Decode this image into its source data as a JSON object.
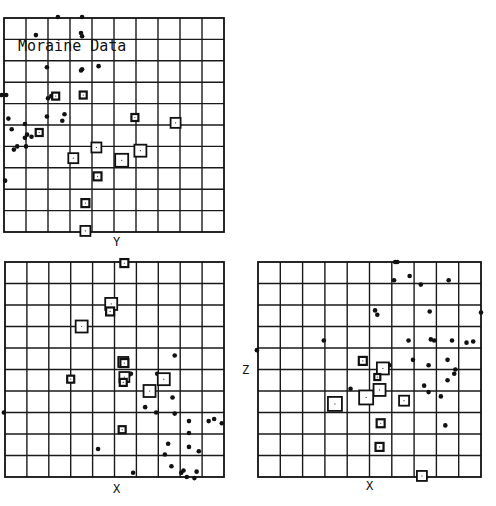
{
  "chart_data": [
    {
      "type": "scatter",
      "title": "Moraine Data",
      "xlabel": "Y",
      "ylabel": "",
      "grid": true,
      "grid_divisions": 10,
      "box": {
        "left": 4,
        "top": 18,
        "width": 220,
        "height": 214
      },
      "series": [
        {
          "name": "dots",
          "marker": "dot",
          "points": [
            [
              2.45,
              -0.05
            ],
            [
              3.55,
              -0.05
            ],
            [
              1.45,
              0.8
            ],
            [
              3.5,
              0.7
            ],
            [
              3.55,
              0.85
            ],
            [
              1.95,
              2.3
            ],
            [
              4.3,
              2.25
            ],
            [
              3.55,
              2.4
            ],
            [
              3.5,
              2.45
            ],
            [
              -0.1,
              3.6
            ],
            [
              0.1,
              3.6
            ],
            [
              2.0,
              3.75
            ],
            [
              2.15,
              3.65
            ],
            [
              2.3,
              3.7
            ],
            [
              1.95,
              4.6
            ],
            [
              2.75,
              4.5
            ],
            [
              2.65,
              4.8
            ],
            [
              0.2,
              4.7
            ],
            [
              0.35,
              5.2
            ],
            [
              0.95,
              4.95
            ],
            [
              1.05,
              5.45
            ],
            [
              1.25,
              5.55
            ],
            [
              0.95,
              5.6
            ],
            [
              0.45,
              6.15
            ],
            [
              0.6,
              6.0
            ],
            [
              1.0,
              6.0
            ],
            [
              0.05,
              7.6
            ]
          ]
        },
        {
          "name": "squares",
          "marker": "square",
          "points": [
            [
              2.35,
              3.65,
              7
            ],
            [
              3.6,
              3.6,
              7
            ],
            [
              1.6,
              5.35,
              7
            ],
            [
              5.95,
              4.65,
              7
            ],
            [
              7.8,
              4.9,
              10
            ],
            [
              4.2,
              6.05,
              10
            ],
            [
              3.15,
              6.55,
              10
            ],
            [
              5.35,
              6.65,
              13
            ],
            [
              6.2,
              6.2,
              12
            ],
            [
              4.25,
              7.4,
              8
            ],
            [
              3.7,
              8.65,
              8
            ],
            [
              3.7,
              9.95,
              10
            ]
          ]
        }
      ]
    },
    {
      "type": "scatter",
      "title": "",
      "xlabel": "X",
      "ylabel": "",
      "grid": true,
      "grid_divisions": 10,
      "box": {
        "left": 5,
        "top": 262,
        "width": 219,
        "height": 215
      },
      "series": [
        {
          "name": "dots",
          "marker": "dot",
          "points": [
            [
              7.75,
              4.35
            ],
            [
              6.95,
              5.2
            ],
            [
              5.75,
              5.2
            ],
            [
              5.65,
              5.25
            ],
            [
              6.5,
              6.05
            ],
            [
              7.65,
              6.3
            ],
            [
              6.4,
              6.75
            ],
            [
              6.9,
              7.0
            ],
            [
              7.75,
              7.05
            ],
            [
              8.4,
              7.4
            ],
            [
              9.3,
              7.4
            ],
            [
              9.55,
              7.3
            ],
            [
              9.9,
              7.5
            ],
            [
              8.4,
              7.95
            ],
            [
              7.45,
              8.45
            ],
            [
              8.4,
              8.6
            ],
            [
              8.85,
              8.8
            ],
            [
              7.3,
              8.95
            ],
            [
              7.6,
              9.5
            ],
            [
              8.15,
              9.7
            ],
            [
              8.05,
              9.8
            ],
            [
              8.75,
              9.75
            ],
            [
              8.3,
              10.0
            ],
            [
              8.65,
              10.05
            ],
            [
              5.85,
              9.8
            ],
            [
              4.25,
              8.7
            ],
            [
              -0.05,
              7.0
            ]
          ]
        },
        {
          "name": "squares",
          "marker": "square",
          "points": [
            [
              5.45,
              0.05,
              8
            ],
            [
              4.85,
              1.95,
              12
            ],
            [
              4.8,
              2.3,
              8
            ],
            [
              3.5,
              3.0,
              12
            ],
            [
              5.4,
              4.65,
              10
            ],
            [
              5.45,
              4.7,
              8
            ],
            [
              5.45,
              5.35,
              10
            ],
            [
              5.4,
              5.6,
              7
            ],
            [
              3.0,
              5.45,
              7
            ],
            [
              7.25,
              5.45,
              12
            ],
            [
              6.6,
              6.0,
              12
            ],
            [
              5.35,
              7.8,
              7
            ]
          ]
        }
      ]
    },
    {
      "type": "scatter",
      "title": "",
      "xlabel": "X",
      "ylabel": "Z",
      "grid": true,
      "grid_divisions": 10,
      "box": {
        "left": 258,
        "top": 262,
        "width": 223,
        "height": 215
      },
      "series": [
        {
          "name": "dots",
          "marker": "dot",
          "points": [
            [
              6.15,
              0.0
            ],
            [
              6.25,
              0.0
            ],
            [
              6.8,
              0.65
            ],
            [
              6.1,
              0.85
            ],
            [
              7.3,
              1.05
            ],
            [
              8.55,
              0.85
            ],
            [
              5.25,
              2.25
            ],
            [
              5.35,
              2.45
            ],
            [
              7.7,
              2.3
            ],
            [
              10.0,
              2.35
            ],
            [
              2.95,
              3.65
            ],
            [
              6.75,
              3.65
            ],
            [
              7.75,
              3.6
            ],
            [
              7.9,
              3.65
            ],
            [
              8.7,
              3.65
            ],
            [
              9.35,
              3.75
            ],
            [
              9.65,
              3.7
            ],
            [
              -0.05,
              4.1
            ],
            [
              6.95,
              4.55
            ],
            [
              7.65,
              4.8
            ],
            [
              8.5,
              4.55
            ],
            [
              8.85,
              5.0
            ],
            [
              8.8,
              5.2
            ],
            [
              8.5,
              5.5
            ],
            [
              7.45,
              5.75
            ],
            [
              7.65,
              6.05
            ],
            [
              8.2,
              6.25
            ],
            [
              4.15,
              5.9
            ],
            [
              5.9,
              4.8
            ],
            [
              8.4,
              7.6
            ]
          ]
        },
        {
          "name": "squares",
          "marker": "square",
          "points": [
            [
              4.7,
              4.6,
              8
            ],
            [
              5.6,
              4.95,
              12
            ],
            [
              5.35,
              5.35,
              6
            ],
            [
              5.45,
              5.95,
              12
            ],
            [
              4.85,
              6.3,
              14
            ],
            [
              3.45,
              6.6,
              14
            ],
            [
              6.55,
              6.45,
              10
            ],
            [
              5.5,
              7.5,
              8
            ],
            [
              5.45,
              8.6,
              8
            ],
            [
              7.35,
              9.95,
              10
            ]
          ]
        }
      ]
    }
  ],
  "title": "Moraine Data",
  "panels": [
    {
      "axis_label": "Y"
    },
    {
      "axis_label": "X"
    },
    {
      "axis_label": "X",
      "side_label": "Z"
    }
  ]
}
